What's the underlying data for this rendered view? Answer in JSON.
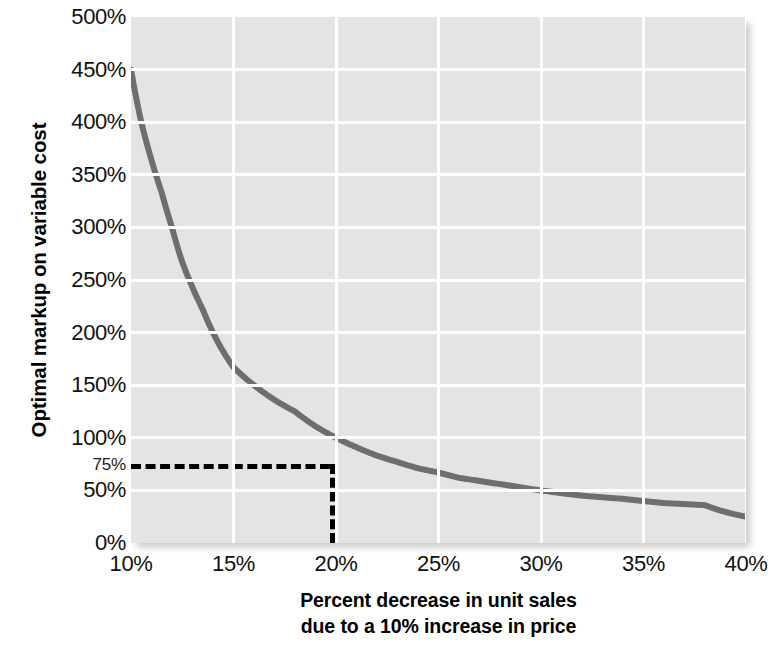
{
  "chart_data": {
    "type": "line",
    "title": "",
    "xlabel": "Percent decrease in unit sales due to a 10% increase in price",
    "xlabel_line1": "Percent decrease in unit sales",
    "xlabel_line2": "due to a 10% increase in price",
    "ylabel": "Optimal markup on variable cost",
    "xlim": [
      10,
      40
    ],
    "ylim": [
      0,
      500
    ],
    "grid": true,
    "legend": null,
    "x_ticks": [
      "10%",
      "15%",
      "20%",
      "25%",
      "30%",
      "35%",
      "40%"
    ],
    "x_tick_values": [
      10,
      15,
      20,
      25,
      30,
      35,
      40
    ],
    "y_ticks": [
      "0%",
      "50%",
      "100%",
      "150%",
      "200%",
      "250%",
      "300%",
      "350%",
      "400%",
      "450%",
      "500%"
    ],
    "y_tick_values": [
      0,
      50,
      100,
      150,
      200,
      250,
      300,
      350,
      400,
      450,
      500
    ],
    "y_extra_ticks": [
      "75%"
    ],
    "y_extra_tick_values": [
      75
    ],
    "series": [
      {
        "name": "Optimal markup",
        "color": "#6e6e6e",
        "x": [
          10.0,
          10.5,
          11.0,
          11.5,
          12.0,
          12.5,
          13.0,
          13.5,
          14.0,
          14.5,
          15.0,
          16.0,
          17.0,
          18.0,
          19.0,
          19.7,
          20.0,
          21.0,
          22.0,
          23.0,
          24.0,
          25.0,
          26.0,
          27.0,
          28.0,
          29.0,
          30.0,
          32.0,
          34.0,
          36.0,
          38.0,
          40.0
        ],
        "values": [
          450,
          400,
          364,
          333,
          300,
          267,
          243,
          222,
          200,
          182,
          167,
          150,
          136,
          125,
          111,
          75,
          100,
          91,
          83,
          77,
          71,
          67,
          62,
          59,
          56,
          53,
          50,
          45,
          42,
          38,
          36,
          25
        ]
      }
    ],
    "annotations": [
      {
        "type": "crosshair",
        "x": 19.7,
        "y": 75,
        "label": "75%",
        "style": "dashed",
        "color": "#000000"
      }
    ],
    "plot_background": "#e4e4e4",
    "gridline_color": "#ffffff",
    "figure_background": "#ffffff"
  }
}
